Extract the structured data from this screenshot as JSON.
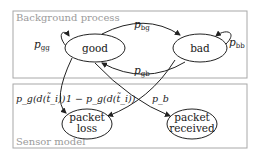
{
  "diagram": {
    "background_process": {
      "label": "Background process",
      "states": {
        "good": "good",
        "bad": "bad"
      },
      "transitions": {
        "gg": {
          "p": "p",
          "sub": "gg"
        },
        "bg": {
          "p": "p",
          "sub": "bg"
        },
        "gb": {
          "p": "p",
          "sub": "gb"
        },
        "bb": {
          "p": "p",
          "sub": "bb"
        }
      }
    },
    "sensor_model": {
      "label": "Sensor model",
      "outcomes": {
        "loss_line1": "packet",
        "loss_line2": "loss",
        "received_line1": "packet",
        "received_line2": "received"
      },
      "transitions": {
        "good_to_loss": "p_g(d(t̃_i))",
        "good_to_received": "1 − p_g(d(t̃_i))",
        "bad_to_loss": "p_b"
      }
    }
  }
}
